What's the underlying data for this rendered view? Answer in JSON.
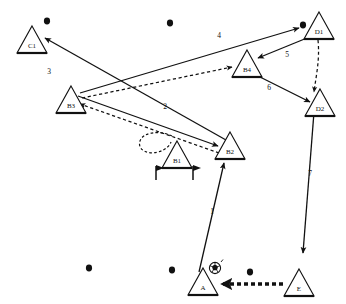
{
  "diagram": {
    "canvas": {
      "width": 346,
      "height": 304
    },
    "nodes": [
      {
        "id": "C1",
        "label": "C1",
        "x": 32,
        "y": 40,
        "size": 15
      },
      {
        "id": "B3",
        "label": "B3",
        "x": 71,
        "y": 100,
        "size": 15
      },
      {
        "id": "B1",
        "label": "B1",
        "x": 177,
        "y": 155,
        "size": 15
      },
      {
        "id": "B2",
        "label": "B2",
        "x": 230,
        "y": 146,
        "size": 15
      },
      {
        "id": "B4",
        "label": "B4",
        "x": 247,
        "y": 64,
        "size": 15
      },
      {
        "id": "D1",
        "label": "D1",
        "x": 319,
        "y": 26,
        "size": 15
      },
      {
        "id": "D2",
        "label": "D2",
        "x": 320,
        "y": 103,
        "size": 15
      },
      {
        "id": "A",
        "label": "A",
        "x": 203,
        "y": 282,
        "size": 15
      },
      {
        "id": "E",
        "label": "E",
        "x": 299,
        "y": 283,
        "size": 15
      }
    ],
    "edges": [
      {
        "id": "e1",
        "label": "1",
        "from": "A",
        "to": "B2",
        "style": "solid",
        "label_x": 212,
        "label_y": 212
      },
      {
        "id": "e2",
        "label": "2",
        "from": "B3",
        "to": "B2",
        "style": "solid",
        "label_x": 165,
        "label_y": 107
      },
      {
        "id": "e3",
        "label": "3",
        "from": "C1",
        "to": "B3",
        "style": "solid",
        "label_x": 49,
        "label_y": 72
      },
      {
        "id": "e4",
        "label": "4",
        "from": "B3",
        "to": "D1",
        "style": "solid",
        "label_x": 219,
        "label_y": 36
      },
      {
        "id": "e5",
        "label": "5",
        "from": "D1",
        "to": "B4",
        "style": "solid",
        "label_x": 287,
        "label_y": 55
      },
      {
        "id": "e6",
        "label": "6",
        "from": "B4",
        "to": "D2",
        "style": "solid",
        "label_x": 269,
        "label_y": 88
      },
      {
        "id": "e7",
        "label": "7",
        "from": "D2",
        "to": "E",
        "style": "solid",
        "label_x": 310,
        "label_y": 174
      },
      {
        "id": "e8",
        "label": "",
        "from": "B2",
        "to": "C1",
        "style": "solid",
        "label_x": 0,
        "label_y": 0
      },
      {
        "id": "e9",
        "label": "",
        "from": "B2",
        "to": "B3",
        "style": "dashed",
        "label_x": 0,
        "label_y": 0
      },
      {
        "id": "e10",
        "label": "",
        "from": "B3",
        "to": "B4",
        "style": "dashed",
        "label_x": 0,
        "label_y": 0
      },
      {
        "id": "e11",
        "label": "",
        "from": "D1",
        "to": "D2",
        "style": "dashed",
        "label_x": 0,
        "label_y": 0
      },
      {
        "id": "e12",
        "label": "",
        "from": "E",
        "to": "A",
        "style": "thick-dashed",
        "label_x": 0,
        "label_y": 0
      }
    ],
    "markers": [
      {
        "id": "m1",
        "type": "dot",
        "x": 47,
        "y": 21
      },
      {
        "id": "m2",
        "type": "dot",
        "x": 170,
        "y": 23
      },
      {
        "id": "m3",
        "type": "dot",
        "x": 303,
        "y": 25
      },
      {
        "id": "m4",
        "type": "dot",
        "x": 89,
        "y": 268
      },
      {
        "id": "m5",
        "type": "dot",
        "x": 172,
        "y": 270
      },
      {
        "id": "m6",
        "type": "dot",
        "x": 250,
        "y": 272
      },
      {
        "id": "f1",
        "type": "flag",
        "x": 156,
        "y": 172
      },
      {
        "id": "f2",
        "type": "flag",
        "x": 193,
        "y": 172
      },
      {
        "id": "ball",
        "type": "ball",
        "x": 215,
        "y": 268
      },
      {
        "id": "loop",
        "type": "dashed-loop",
        "x": 155,
        "y": 146
      }
    ]
  }
}
